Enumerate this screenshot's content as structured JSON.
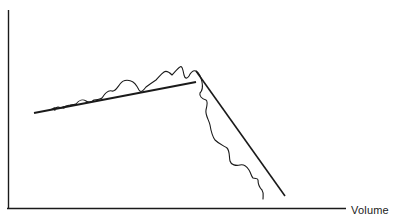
{
  "diagram": {
    "x_axis_label": "Volume",
    "y_axis_label": "",
    "colors": {
      "ink": "#1a1a1a",
      "background": "#ffffff"
    },
    "trend_lines": [
      {
        "name": "rising-trend",
        "from": [
          34,
          113
        ],
        "to": [
          196,
          82
        ]
      },
      {
        "name": "falling-trend",
        "from": [
          196,
          72
        ],
        "to": [
          285,
          196
        ]
      }
    ],
    "peak_point": [
      196,
      72
    ]
  }
}
